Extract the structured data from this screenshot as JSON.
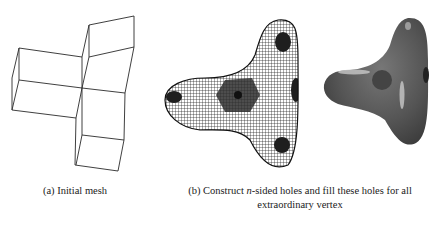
{
  "figure": {
    "panels": [
      {
        "id": "a",
        "label": "(a)",
        "caption": "(a) Initial mesh",
        "content": "wireframe control mesh of three quadrilateral box arms meeting at a central extraordinary vertex"
      },
      {
        "id": "b",
        "label": "(b)",
        "caption_prefix": "(b) Construct ",
        "caption_italic": "n",
        "caption_suffix": "-sided holes and fill these holes for all",
        "caption_line2": "extraordinary vertex",
        "content": "dense quad surface mesh with n-sided filled patches (dark regions) and a shaded rendering of the resulting surface"
      }
    ],
    "colors": {
      "line": "#2a2a2a",
      "shaded_surface": "#5a5a5a",
      "patch_dark": "#1e1e1e"
    }
  }
}
